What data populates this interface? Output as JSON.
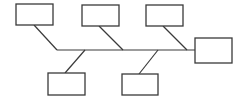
{
  "diagram": {
    "type": "fishbone",
    "stroke_color": "#3a3a3a",
    "background": "#ffffff",
    "spine": {
      "x1": 57,
      "y1": 50,
      "x2": 195,
      "y2": 50
    },
    "head": {
      "label": "",
      "x": 195,
      "y": 38,
      "w": 37,
      "h": 25
    },
    "causes": [
      {
        "label": "",
        "position": "top",
        "box": {
          "x": 16,
          "y": 4,
          "w": 37,
          "h": 21
        },
        "bone": {
          "x1": 34,
          "y1": 25,
          "x2": 57,
          "y2": 50
        }
      },
      {
        "label": "",
        "position": "top",
        "box": {
          "x": 82,
          "y": 5,
          "w": 37,
          "h": 21
        },
        "bone": {
          "x1": 99,
          "y1": 26,
          "x2": 123,
          "y2": 50
        }
      },
      {
        "label": "",
        "position": "top",
        "box": {
          "x": 146,
          "y": 5,
          "w": 37,
          "h": 21
        },
        "bone": {
          "x1": 163,
          "y1": 26,
          "x2": 187,
          "y2": 50
        }
      },
      {
        "label": "",
        "position": "bottom",
        "box": {
          "x": 48,
          "y": 73,
          "w": 37,
          "h": 22
        },
        "bone": {
          "x1": 65,
          "y1": 73,
          "x2": 85,
          "y2": 50
        }
      },
      {
        "label": "",
        "position": "bottom",
        "box": {
          "x": 122,
          "y": 74,
          "w": 36,
          "h": 21
        },
        "bone": {
          "x1": 139,
          "y1": 74,
          "x2": 158,
          "y2": 50
        }
      }
    ]
  }
}
